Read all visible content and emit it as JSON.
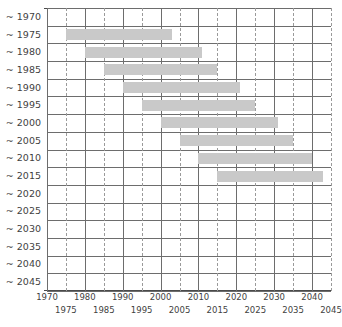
{
  "chart_data": {
    "type": "bar",
    "orientation": "horizontal",
    "subtype": "gantt-range-bars",
    "title": "",
    "subtitle": "",
    "xlabel": "",
    "ylabel": "",
    "xlim": [
      1970,
      2045
    ],
    "ylim_categories": [
      "~ 1970",
      "~ 1975",
      "~ 1980",
      "~ 1985",
      "~ 1990",
      "~ 1995",
      "~ 2000",
      "~ 2005",
      "~ 2010",
      "~ 2015",
      "~ 2020",
      "~ 2025",
      "~ 2030",
      "~ 2035",
      "~ 2040",
      "~ 2045"
    ],
    "categories": [
      "~ 1970",
      "~ 1975",
      "~ 1980",
      "~ 1985",
      "~ 1990",
      "~ 1995",
      "~ 2000",
      "~ 2005",
      "~ 2010",
      "~ 2015",
      "~ 2020",
      "~ 2025",
      "~ 2030",
      "~ 2035",
      "~ 2040",
      "~ 2045"
    ],
    "x_ticks_major": [
      1970,
      1980,
      1990,
      2000,
      2010,
      2020,
      2030,
      2040
    ],
    "x_ticks_minor": [
      1975,
      1985,
      1995,
      2005,
      2015,
      2025,
      2035,
      2045
    ],
    "x_tick_labels_major": [
      "1970",
      "1980",
      "1990",
      "2000",
      "2010",
      "2020",
      "2030",
      "2040"
    ],
    "x_tick_labels_minor": [
      "1975",
      "1985",
      "1995",
      "2005",
      "2015",
      "2025",
      "2035",
      "2045"
    ],
    "grid": true,
    "grid_major_style": "solid",
    "grid_minor_style": "dashed",
    "legend": false,
    "legend_position": "none",
    "bar_color": "#c9c9c9",
    "grid_color": "#6d6d6d",
    "grid_minor_color": "#9a9a9a",
    "axis_color": "#4a4a4a",
    "text_color": "#3f3f3f",
    "bars": [
      {
        "category": "~ 1970",
        "start": null,
        "end": null,
        "duration": null
      },
      {
        "category": "~ 1975",
        "start": 1975,
        "end": 2003,
        "duration": 28
      },
      {
        "category": "~ 1980",
        "start": 1980,
        "end": 2011,
        "duration": 31
      },
      {
        "category": "~ 1985",
        "start": 1985,
        "end": 2015,
        "duration": 30
      },
      {
        "category": "~ 1990",
        "start": 1990,
        "end": 2021,
        "duration": 31
      },
      {
        "category": "~ 1995",
        "start": 1995,
        "end": 2025,
        "duration": 30
      },
      {
        "category": "~ 2000",
        "start": 2000,
        "end": 2031,
        "duration": 31
      },
      {
        "category": "~ 2005",
        "start": 2005,
        "end": 2035,
        "duration": 30
      },
      {
        "category": "~ 2010",
        "start": 2010,
        "end": 2040,
        "duration": 30
      },
      {
        "category": "~ 2015",
        "start": 2015,
        "end": 2043,
        "duration": 28
      },
      {
        "category": "~ 2020",
        "start": null,
        "end": null,
        "duration": null
      },
      {
        "category": "~ 2025",
        "start": null,
        "end": null,
        "duration": null
      },
      {
        "category": "~ 2030",
        "start": null,
        "end": null,
        "duration": null
      },
      {
        "category": "~ 2035",
        "start": null,
        "end": null,
        "duration": null
      },
      {
        "category": "~ 2040",
        "start": null,
        "end": null,
        "duration": null
      },
      {
        "category": "~ 2045",
        "start": null,
        "end": null,
        "duration": null
      }
    ]
  }
}
